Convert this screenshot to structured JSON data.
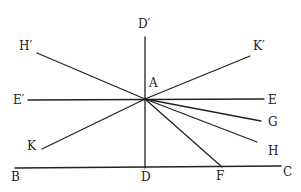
{
  "diagram": {
    "type": "geometric-construction",
    "center_point": "A",
    "labels": {
      "D_prime": "D′",
      "H_prime": "H′",
      "K_prime": "K′",
      "E_prime": "E′",
      "A": "A",
      "E": "E",
      "G": "G",
      "H": "H",
      "K": "K",
      "B": "B",
      "D": "D",
      "F": "F",
      "C": "C"
    },
    "lines": [
      {
        "name": "line-BC",
        "from": "B",
        "to": "C"
      },
      {
        "name": "line-DprimeD",
        "from": "D′",
        "to": "D"
      },
      {
        "name": "line-EprimeE",
        "from": "E′",
        "to": "E"
      },
      {
        "name": "line-HprimeA",
        "from": "H′",
        "to": "A"
      },
      {
        "name": "line-AKprime",
        "from": "A",
        "to": "K′"
      },
      {
        "name": "line-KA",
        "from": "K",
        "to": "A"
      },
      {
        "name": "line-AG",
        "from": "A",
        "to": "G"
      },
      {
        "name": "line-AH",
        "from": "A",
        "to": "H"
      },
      {
        "name": "line-AF",
        "from": "A",
        "to": "F"
      }
    ]
  }
}
